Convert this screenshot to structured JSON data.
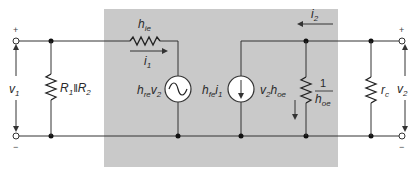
{
  "colors": {
    "background": "#ffffff",
    "transistor_box": "#c9c9c9",
    "wire": "#333333",
    "node": "#111111"
  },
  "figure": {
    "caption_fragment": "",
    "box_label": "transistor h-parameter equivalent model"
  },
  "input_port": {
    "plus": "+",
    "minus": "−",
    "voltage": {
      "main": "v",
      "sub": "1"
    }
  },
  "bias_resistor": {
    "label": {
      "a": "R",
      "a_sub": "1",
      "sep": "‖",
      "b": "R",
      "b_sub": "2"
    }
  },
  "hie_resistor": {
    "label": {
      "main": "h",
      "sub": "ie"
    }
  },
  "input_current": {
    "label": {
      "main": "i",
      "sub": "1"
    }
  },
  "voltage_source": {
    "label": {
      "main": "h",
      "sub": "re",
      "mult": "v",
      "mult_sub": "2"
    },
    "icon": "ac-source-icon"
  },
  "current_source": {
    "label": {
      "main": "h",
      "sub": "fe",
      "mult": "i",
      "mult_sub": "1"
    },
    "icon": "dependent-current-source-icon"
  },
  "output_conductance_current": {
    "label": {
      "main": "v",
      "sub": "2",
      "mult": "h",
      "mult_sub": "oe"
    }
  },
  "hoe_resistor": {
    "label": {
      "num": "1",
      "den": "h",
      "den_sub": "oe"
    }
  },
  "output_current": {
    "label": {
      "main": "i",
      "sub": "2"
    }
  },
  "load_resistor": {
    "label": {
      "main": "r",
      "sub": "c"
    }
  },
  "output_port": {
    "plus": "+",
    "minus": "−",
    "voltage": {
      "main": "v",
      "sub": "2"
    }
  }
}
